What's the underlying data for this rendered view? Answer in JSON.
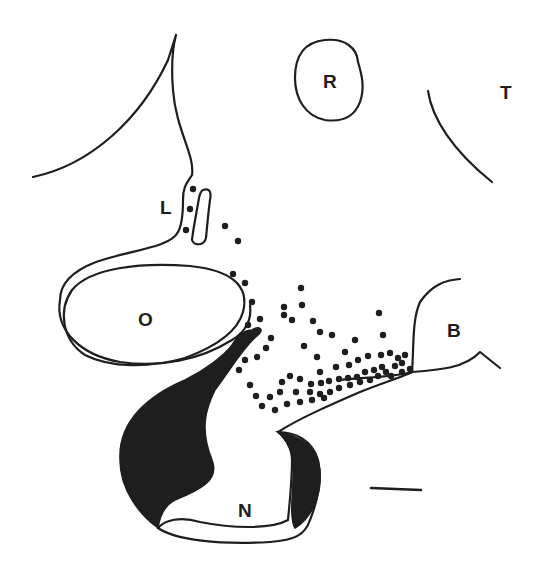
{
  "diagram": {
    "labels": {
      "L": "L",
      "R": "R",
      "T": "T",
      "O": "O",
      "B": "B",
      "N": "N"
    },
    "colors": {
      "ink": "#1e1e1e",
      "background": "#ffffff"
    },
    "scale_bar": {
      "x1": 371,
      "y1": 488,
      "x2": 421,
      "y2": 490
    },
    "dots": [
      [
        193,
        189
      ],
      [
        190,
        209
      ],
      [
        186,
        230
      ],
      [
        225,
        226
      ],
      [
        238,
        241
      ],
      [
        233,
        274
      ],
      [
        245,
        283
      ],
      [
        252,
        302
      ],
      [
        301,
        288
      ],
      [
        284,
        307
      ],
      [
        284,
        315
      ],
      [
        302,
        305
      ],
      [
        292,
        320
      ],
      [
        260,
        319
      ],
      [
        248,
        325
      ],
      [
        313,
        321
      ],
      [
        320,
        332
      ],
      [
        304,
        346
      ],
      [
        271,
        338
      ],
      [
        266,
        348
      ],
      [
        257,
        357
      ],
      [
        245,
        360
      ],
      [
        239,
        370
      ],
      [
        332,
        335
      ],
      [
        379,
        313
      ],
      [
        383,
        335
      ],
      [
        355,
        340
      ],
      [
        345,
        352
      ],
      [
        317,
        357
      ],
      [
        336,
        367
      ],
      [
        320,
        372
      ],
      [
        349,
        365
      ],
      [
        358,
        360
      ],
      [
        368,
        356
      ],
      [
        381,
        355
      ],
      [
        390,
        353
      ],
      [
        398,
        358
      ],
      [
        382,
        367
      ],
      [
        374,
        370
      ],
      [
        365,
        372
      ],
      [
        357,
        377
      ],
      [
        348,
        378
      ],
      [
        339,
        379
      ],
      [
        329,
        381
      ],
      [
        321,
        383
      ],
      [
        311,
        384
      ],
      [
        300,
        379
      ],
      [
        290,
        376
      ],
      [
        282,
        382
      ],
      [
        296,
        392
      ],
      [
        310,
        392
      ],
      [
        320,
        394
      ],
      [
        330,
        392
      ],
      [
        339,
        388
      ],
      [
        350,
        385
      ],
      [
        360,
        382
      ],
      [
        370,
        380
      ],
      [
        378,
        376
      ],
      [
        386,
        372
      ],
      [
        395,
        366
      ],
      [
        402,
        363
      ],
      [
        405,
        355
      ],
      [
        410,
        369
      ],
      [
        402,
        372
      ],
      [
        391,
        376
      ],
      [
        280,
        392
      ],
      [
        270,
        397
      ],
      [
        262,
        406
      ],
      [
        275,
        410
      ],
      [
        287,
        404
      ],
      [
        300,
        402
      ],
      [
        312,
        400
      ],
      [
        324,
        398
      ],
      [
        256,
        396
      ],
      [
        250,
        385
      ]
    ]
  }
}
